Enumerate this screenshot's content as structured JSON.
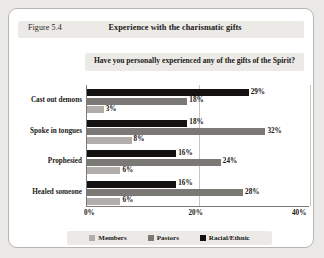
{
  "figure": {
    "number": "Figure 5.4",
    "title": "Experience with the charismatic gifts",
    "subtitle": "Have you personally experienced any of the gifts of the Spirit?"
  },
  "legend": {
    "items": [
      {
        "label": "Members",
        "color": "#b0adaa"
      },
      {
        "label": "Pastors",
        "color": "#7b7976"
      },
      {
        "label": "Racial/Ethnic",
        "color": "#131211"
      }
    ]
  },
  "chart_data": {
    "type": "bar",
    "orientation": "horizontal",
    "title": "Experience with the charismatic gifts",
    "subtitle": "Have you personally experienced any of the gifts of the Spirit?",
    "xlabel": "",
    "ylabel": "",
    "xlim": [
      0,
      40
    ],
    "xticks": [
      "0%",
      "20%",
      "40%"
    ],
    "xtick_values": [
      0,
      20,
      40
    ],
    "grid": true,
    "legend_position": "bottom",
    "categories": [
      "Cast out demons",
      "Spoke in tongues",
      "Prophesied",
      "Healed someone"
    ],
    "series": [
      {
        "name": "Racial/Ethnic",
        "color": "#131211",
        "values": [
          29,
          18,
          16,
          16
        ],
        "labels": [
          "29%",
          "18%",
          "16%",
          "16%"
        ]
      },
      {
        "name": "Pastors",
        "color": "#7b7976",
        "values": [
          18,
          32,
          24,
          28
        ],
        "labels": [
          "18%",
          "32%",
          "24%",
          "28%"
        ]
      },
      {
        "name": "Members",
        "color": "#b0adaa",
        "values": [
          3,
          8,
          6,
          6
        ],
        "labels": [
          "3%",
          "8%",
          "6%",
          "6%"
        ]
      }
    ]
  }
}
